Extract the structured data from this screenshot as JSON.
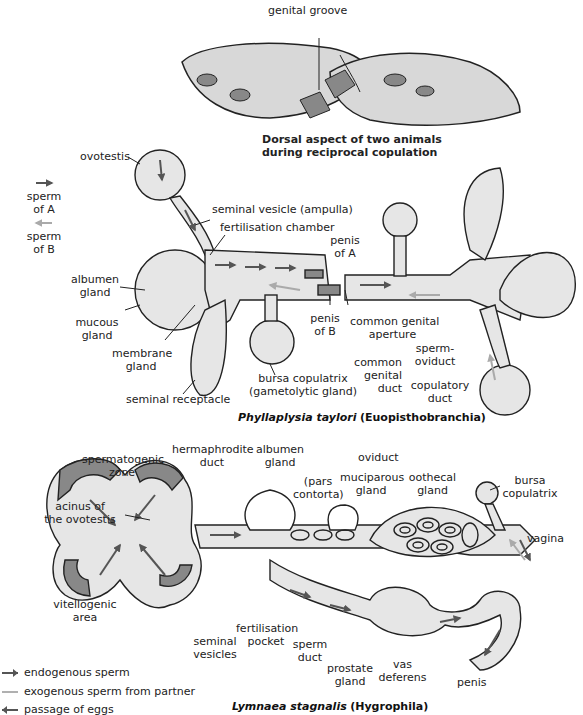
{
  "header_fragment": "gy,",
  "dorsal_view": {
    "label_genital_groove": "genital groove",
    "caption_line1": "Dorsal aspect of two animals",
    "caption_line2": "during reciprocal copulation"
  },
  "phyllaplysia": {
    "legend": {
      "sperm_a": "sperm of A",
      "sperm_a_line1": "sperm",
      "sperm_a_line2": "of A",
      "sperm_b_line1": "sperm",
      "sperm_b_line2": "of B",
      "sperm_a_color": "#555555",
      "sperm_b_color": "#aaaaaa"
    },
    "labels": {
      "ovotestis": "ovotestis",
      "seminal_vesicle": "seminal vesicle (ampulla)",
      "fertilisation_chamber": "fertilisation chamber",
      "albumen_gland_1": "albumen",
      "albumen_gland_2": "gland",
      "mucous_gland_1": "mucous",
      "mucous_gland_2": "gland",
      "membrane_gland_1": "membrane",
      "membrane_gland_2": "gland",
      "seminal_receptacle": "seminal receptacle",
      "bursa_copulatrix_1": "bursa copulatrix",
      "bursa_copulatrix_2": "(gametolytic gland)",
      "penis_a_1": "penis",
      "penis_a_2": "of A",
      "penis_b_1": "penis",
      "penis_b_2": "of B",
      "common_genital_aperture_1": "common genital",
      "common_genital_aperture_2": "aperture",
      "common_genital_duct_1": "common",
      "common_genital_duct_2": "genital",
      "common_genital_duct_3": "duct",
      "spermoviduct_1": "sperm-",
      "spermoviduct_2": "oviduct",
      "copulatory_duct_1": "copulatory",
      "copulatory_duct_2": "duct"
    },
    "caption_species": "Phyllaplysia taylori",
    "caption_group": "(Euopisthobranchia)"
  },
  "lymnaea": {
    "labels": {
      "spermatogenic_zone_1": "spermatogenic",
      "spermatogenic_zone_2": "zone",
      "hermaphrodite_duct_1": "hermaphrodite",
      "hermaphrodite_duct_2": "duct",
      "albumen_gland_1": "albumen",
      "albumen_gland_2": "gland",
      "oviduct": "oviduct",
      "pars_contorta_1": "(pars",
      "pars_contorta_2": "contorta)",
      "muciparous_gland_1": "muciparous",
      "muciparous_gland_2": "gland",
      "oothecal_gland_1": "oothecal",
      "oothecal_gland_2": "gland",
      "bursa_copulatrix_1": "bursa",
      "bursa_copulatrix_2": "copulatrix",
      "vagina": "vagina",
      "acinus_1": "acinus of",
      "acinus_2": "the ovotestis",
      "vitellogenic_1": "vitellogenic",
      "vitellogenic_2": "area",
      "seminal_vesicles_1": "seminal",
      "seminal_vesicles_2": "vesicles",
      "fertilisation_pocket_1": "fertilisation",
      "fertilisation_pocket_2": "pocket",
      "sperm_duct_1": "sperm",
      "sperm_duct_2": "duct",
      "prostate_gland_1": "prostate",
      "prostate_gland_2": "gland",
      "vas_deferens_1": "vas",
      "vas_deferens_2": "deferens",
      "penis": "penis"
    },
    "legend": [
      {
        "label": "endogenous sperm",
        "color": "#555555",
        "direction": "right"
      },
      {
        "label": "exogenous sperm from partner",
        "color": "#b0b0b0",
        "direction": "left"
      },
      {
        "label": "passage of eggs",
        "color": "#555555",
        "direction": "left"
      }
    ],
    "caption_species": "Lymnaea stagnalis",
    "caption_group": "(Hygrophila)"
  },
  "colors": {
    "organ_fill": "#e6e6e6",
    "dark_fill": "#8a8a8a",
    "outline": "#222222",
    "arrow_dark": "#555555",
    "arrow_light": "#aaaaaa"
  }
}
